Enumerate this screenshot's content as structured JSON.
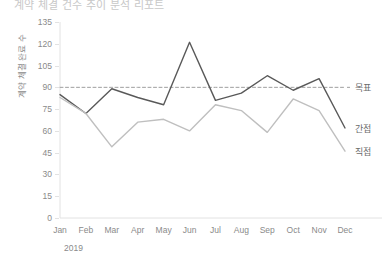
{
  "title": "계약 체결 건수 추이 분석 리포트",
  "axis": {
    "y_title": "계약 체결 완료 수",
    "x_group_label": "2019"
  },
  "chart_data": {
    "type": "line",
    "title": "계약 체결 건수 추이 분석 리포트",
    "xlabel": "2019",
    "ylabel": "계약 체결 완료 수",
    "ylim": [
      0,
      135
    ],
    "ytick_values": [
      0,
      15,
      30,
      45,
      60,
      75,
      90,
      105,
      120,
      135
    ],
    "ytick_labels": [
      "0",
      "15",
      "30",
      "45",
      "60",
      "75",
      "90",
      "105",
      "120",
      "135"
    ],
    "grid": false,
    "legend_position": "right-inline",
    "categories": [
      "Jan",
      "Feb",
      "Mar",
      "Apr",
      "May",
      "Jun",
      "Jul",
      "Aug",
      "Sep",
      "Oct",
      "Nov",
      "Dec"
    ],
    "series": [
      {
        "name": "목표",
        "style": "dashed",
        "color": "#9e9e9e",
        "constant": 90,
        "values": [
          90,
          90,
          90,
          90,
          90,
          90,
          90,
          90,
          90,
          90,
          90,
          90
        ]
      },
      {
        "name": "간접",
        "style": "solid",
        "color": "#595959",
        "values": [
          85,
          72,
          89,
          83,
          78,
          121,
          81,
          86,
          98,
          88,
          96,
          62
        ]
      },
      {
        "name": "직접",
        "style": "solid",
        "color": "#bfbfbf",
        "values": [
          83,
          72,
          49,
          66,
          68,
          60,
          78,
          74,
          59,
          82,
          74,
          46
        ]
      }
    ]
  }
}
